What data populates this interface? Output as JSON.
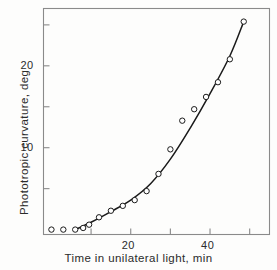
{
  "figure": {
    "background_color": "#fdfdfc",
    "frame_color": "#8a8a8a",
    "ink_color": "#1a1a1a"
  },
  "axes": {
    "ylabel": "Phototropic curvature, deg",
    "xlabel": "Time in unilateral light, min",
    "y_ticklabels": [
      {
        "value": 20,
        "text": "20"
      },
      {
        "value": 10,
        "text": "10"
      }
    ],
    "x_ticklabels": [
      {
        "value": 20,
        "text": "20"
      },
      {
        "value": 40,
        "text": "40"
      }
    ]
  },
  "chart_data": {
    "type": "scatter",
    "title": "",
    "xlabel": "Time in unilateral light, min",
    "ylabel": "Phototropic curvature, deg",
    "xlim": [
      -2,
      55
    ],
    "ylim": [
      -0.6,
      27
    ],
    "grid": false,
    "legend": null,
    "marker": "open-circle",
    "x_major_ticks": [
      10,
      20,
      30,
      40,
      50
    ],
    "y_major_ticks": [
      5,
      10,
      15,
      20,
      25
    ],
    "x_labeled_ticks": [
      20,
      40
    ],
    "y_labeled_ticks": [
      10,
      20
    ],
    "series": [
      {
        "name": "Phototropic curvature",
        "kind": "points",
        "x": [
          0,
          3,
          6,
          8,
          9.5,
          12,
          15,
          18,
          21,
          24,
          27,
          30,
          33,
          36,
          39,
          42,
          45,
          48.5
        ],
        "y": [
          0,
          0,
          0,
          0.2,
          0.6,
          1.5,
          2.3,
          2.9,
          3.6,
          4.7,
          6.8,
          9.8,
          13.3,
          14.7,
          16.2,
          18.0,
          20.8,
          25.4
        ]
      },
      {
        "name": "Fitted curve",
        "kind": "line",
        "x": [
          6,
          10,
          15,
          20,
          25,
          30,
          35,
          40,
          45,
          48.5
        ],
        "y": [
          0,
          0.9,
          2.2,
          3.6,
          5.6,
          8.6,
          12.4,
          16.6,
          21.2,
          25.4
        ]
      }
    ]
  }
}
